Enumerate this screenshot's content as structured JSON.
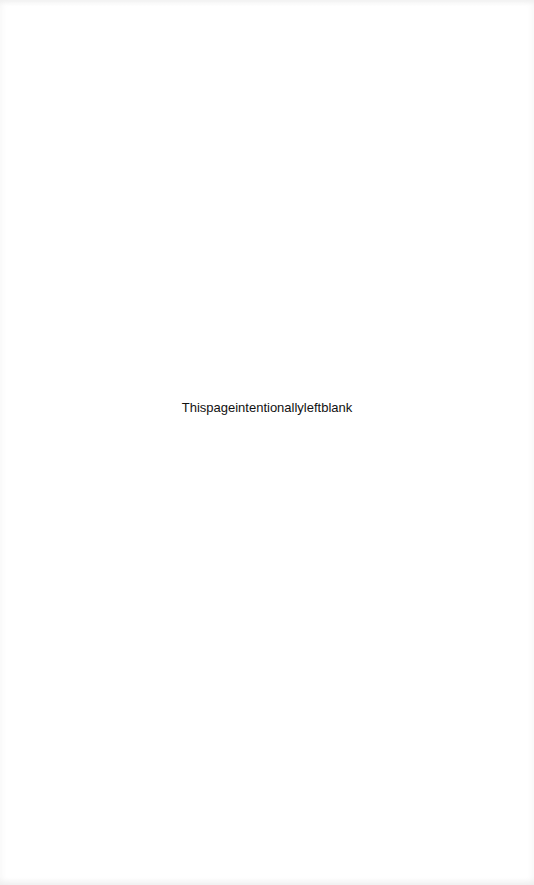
{
  "page": {
    "notice_text": "Thispageintentionallyleftblank",
    "background_color": "#ffffff",
    "text_color": "#111111"
  }
}
